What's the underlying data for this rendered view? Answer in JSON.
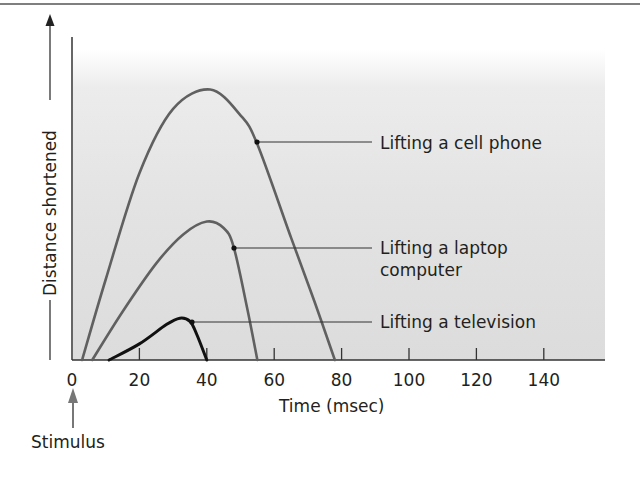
{
  "chart_data": {
    "type": "line",
    "title": "",
    "xlabel": "Time (msec)",
    "ylabel": "Distance shortened",
    "xlim": [
      0,
      155
    ],
    "ylim": [
      0,
      100
    ],
    "x_ticks": [
      0,
      20,
      40,
      60,
      80,
      100,
      120,
      140
    ],
    "y_ticks": [],
    "grid": false,
    "legend_position": "inline-right (leader lines)",
    "annotations": [
      {
        "text": "Stimulus",
        "x": 0,
        "kind": "upward arrow below x-axis at 0"
      }
    ],
    "series": [
      {
        "name": "Lifting a cell phone",
        "color": "#606060",
        "points": [
          [
            3,
            0
          ],
          [
            10,
            25
          ],
          [
            20,
            58
          ],
          [
            30,
            78
          ],
          [
            41,
            84
          ],
          [
            50,
            76
          ],
          [
            55,
            67
          ],
          [
            65,
            38
          ],
          [
            72,
            18
          ],
          [
            78,
            0
          ]
        ]
      },
      {
        "name": "Lifting a laptop computer",
        "color": "#606060",
        "points": [
          [
            6,
            0
          ],
          [
            15,
            15
          ],
          [
            25,
            30
          ],
          [
            33,
            39
          ],
          [
            40,
            43
          ],
          [
            45,
            41
          ],
          [
            48,
            35
          ],
          [
            52,
            16
          ],
          [
            55,
            0
          ]
        ]
      },
      {
        "name": "Lifting a television",
        "color": "#111111",
        "points": [
          [
            11,
            0
          ],
          [
            20,
            5
          ],
          [
            28,
            11
          ],
          [
            32,
            13
          ],
          [
            35,
            12
          ],
          [
            37,
            8
          ],
          [
            40,
            0
          ]
        ]
      }
    ]
  },
  "labels": {
    "ylabel": "Distance shortened",
    "xlabel": "Time (msec)",
    "stimulus": "Stimulus",
    "ticks": [
      "0",
      "20",
      "40",
      "60",
      "80",
      "100",
      "120",
      "140"
    ],
    "legend": [
      "Lifting a cell phone",
      "Lifting a laptop",
      "computer",
      "Lifting a television"
    ]
  }
}
